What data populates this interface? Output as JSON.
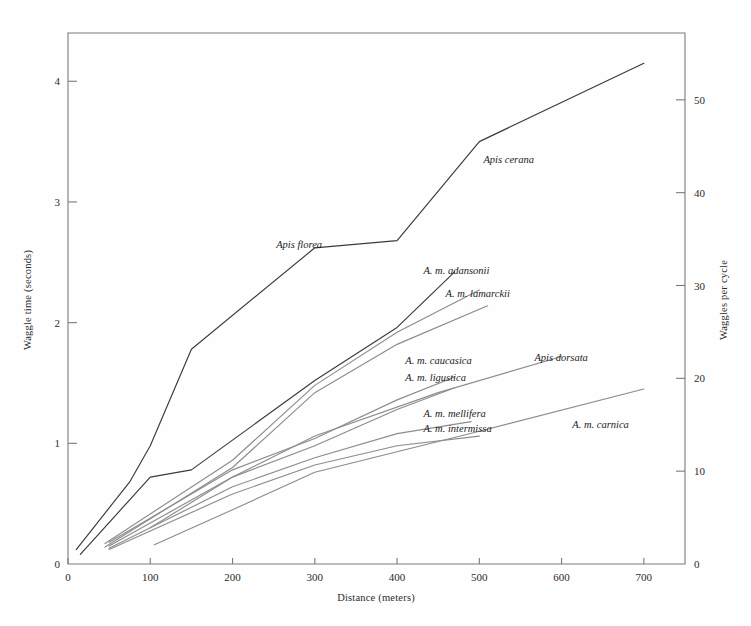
{
  "figure": {
    "background": "#fefefe",
    "frame_color": "#7a7a7a"
  },
  "chart_data": {
    "type": "line",
    "title": "",
    "xlabel": "Distance (meters)",
    "ylabel": "Waggle time (seconds)",
    "y2label": "Waggles per cycle",
    "xlim": [
      0,
      750
    ],
    "ylim": [
      0,
      4.4
    ],
    "y2lim": [
      0,
      57.2
    ],
    "xticks": [
      0,
      100,
      200,
      300,
      400,
      500,
      600,
      700
    ],
    "yticks": [
      0,
      1,
      2,
      3,
      4
    ],
    "y2ticks": [
      0,
      10,
      20,
      30,
      40,
      50
    ],
    "grid": false,
    "legend": "inline-labels",
    "series": [
      {
        "name": "Apis cerana",
        "color": "#3a3a3f",
        "label_x": 505,
        "label_y": 3.32,
        "label_anchor": "start",
        "points": [
          [
            10,
            0.12
          ],
          [
            75,
            0.68
          ],
          [
            100,
            0.98
          ],
          [
            150,
            1.78
          ],
          [
            300,
            2.62
          ],
          [
            400,
            2.68
          ],
          [
            500,
            3.5
          ],
          [
            700,
            4.15
          ]
        ]
      },
      {
        "name": "Apis florea",
        "color": "#3a3a3f",
        "label_x": 253,
        "label_y": 2.62,
        "label_anchor": "start",
        "points": [
          [
            15,
            0.08
          ],
          [
            100,
            0.72
          ],
          [
            150,
            0.78
          ],
          [
            300,
            1.52
          ],
          [
            400,
            1.96
          ],
          [
            470,
            2.42
          ]
        ]
      },
      {
        "name": "A. m. adansonii",
        "color": "#8c8c90",
        "label_x": 432,
        "label_y": 2.4,
        "label_anchor": "start",
        "points": [
          [
            45,
            0.17
          ],
          [
            200,
            0.86
          ],
          [
            300,
            1.48
          ],
          [
            400,
            1.92
          ],
          [
            500,
            2.27
          ]
        ]
      },
      {
        "name": "A. m. lamarckii",
        "color": "#8c8c90",
        "label_x": 459,
        "label_y": 2.21,
        "label_anchor": "start",
        "points": [
          [
            45,
            0.14
          ],
          [
            200,
            0.8
          ],
          [
            300,
            1.42
          ],
          [
            400,
            1.82
          ],
          [
            510,
            2.14
          ]
        ]
      },
      {
        "name": "Apis dorsata",
        "color": "#8c8c90",
        "label_x": 567,
        "label_y": 1.68,
        "label_anchor": "start",
        "points": [
          [
            100,
            0.3
          ],
          [
            200,
            0.72
          ],
          [
            300,
            1.06
          ],
          [
            450,
            1.42
          ],
          [
            600,
            1.72
          ]
        ]
      },
      {
        "name": "A. m. caucasica",
        "color": "#8c8c90",
        "label_x": 410,
        "label_y": 1.66,
        "label_anchor": "start",
        "points": [
          [
            50,
            0.18
          ],
          [
            200,
            0.78
          ],
          [
            300,
            1.04
          ],
          [
            400,
            1.36
          ],
          [
            470,
            1.55
          ]
        ]
      },
      {
        "name": "A. m. ligustica",
        "color": "#8c8c90",
        "label_x": 410,
        "label_y": 1.52,
        "label_anchor": "start",
        "points": [
          [
            50,
            0.15
          ],
          [
            200,
            0.72
          ],
          [
            300,
            0.98
          ],
          [
            400,
            1.28
          ],
          [
            470,
            1.46
          ]
        ]
      },
      {
        "name": "A. m. mellifera",
        "color": "#8c8c90",
        "label_x": 432,
        "label_y": 1.22,
        "label_anchor": "start",
        "points": [
          [
            50,
            0.13
          ],
          [
            200,
            0.64
          ],
          [
            300,
            0.88
          ],
          [
            400,
            1.08
          ],
          [
            490,
            1.18
          ]
        ]
      },
      {
        "name": "A. m. intermissa",
        "color": "#8c8c90",
        "label_x": 432,
        "label_y": 1.09,
        "label_anchor": "start",
        "points": [
          [
            50,
            0.12
          ],
          [
            200,
            0.58
          ],
          [
            300,
            0.82
          ],
          [
            400,
            0.98
          ],
          [
            500,
            1.06
          ]
        ]
      },
      {
        "name": "A. m. carnica",
        "color": "#8c8c90",
        "label_x": 613,
        "label_y": 1.13,
        "label_anchor": "start",
        "points": [
          [
            105,
            0.16
          ],
          [
            200,
            0.45
          ],
          [
            300,
            0.76
          ],
          [
            500,
            1.1
          ],
          [
            700,
            1.45
          ]
        ]
      }
    ]
  }
}
